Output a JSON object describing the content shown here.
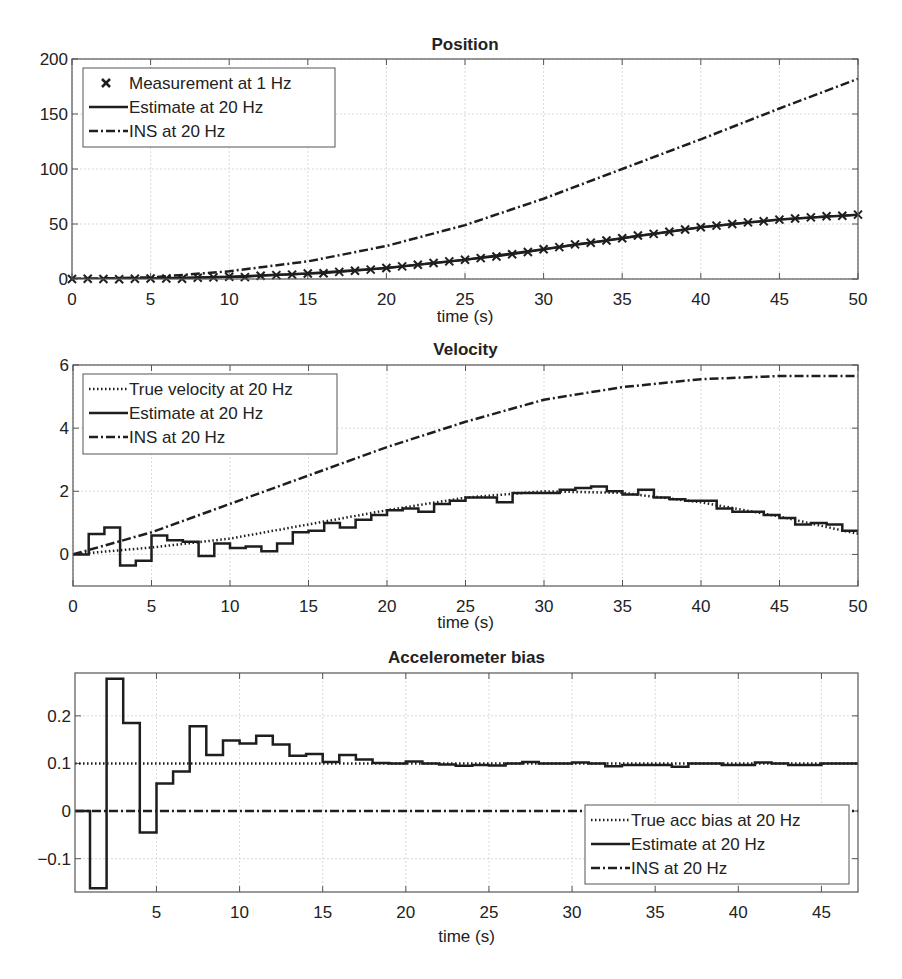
{
  "figure": {
    "width": 902,
    "height": 979
  },
  "colors": {
    "line": "#1e1e1e",
    "grid": "#d9d9d9",
    "axis": "#555555",
    "text": "#222222"
  },
  "chart_data": [
    {
      "type": "line",
      "title": "Position",
      "xlabel": "time (s)",
      "ylabel": "",
      "xlim": [
        0,
        50
      ],
      "ylim": [
        0,
        200
      ],
      "xticks": [
        0,
        5,
        10,
        15,
        20,
        25,
        30,
        35,
        40,
        45,
        50
      ],
      "yticks": [
        0,
        50,
        100,
        150,
        200
      ],
      "grid": true,
      "legend_position": "upper-left",
      "legend": [
        "Measurement at 1 Hz",
        "Estimate at 20 Hz",
        "INS at 20 Hz"
      ],
      "series": [
        {
          "name": "Measurement at 1 Hz",
          "style": "marker-x",
          "x": [
            0,
            1,
            2,
            3,
            4,
            5,
            6,
            7,
            8,
            9,
            10,
            11,
            12,
            13,
            14,
            15,
            16,
            17,
            18,
            19,
            20,
            21,
            22,
            23,
            24,
            25,
            26,
            27,
            28,
            29,
            30,
            31,
            32,
            33,
            34,
            35,
            36,
            37,
            38,
            39,
            40,
            41,
            42,
            43,
            44,
            45,
            46,
            47,
            48,
            49,
            50
          ],
          "y": [
            0,
            0.3,
            0,
            -0.3,
            0.3,
            0.5,
            0.5,
            0.3,
            1.2,
            1.5,
            2,
            1.7,
            3,
            3.5,
            4,
            5,
            5.3,
            6.5,
            7.5,
            8.5,
            10,
            11.5,
            13,
            14.5,
            16,
            17.5,
            19,
            20.5,
            22.5,
            24.5,
            27,
            29,
            31.5,
            33,
            35,
            37,
            39.5,
            41,
            43,
            45,
            47,
            48.5,
            50,
            51.5,
            52.5,
            54,
            55,
            56,
            57,
            57.5,
            58.5
          ]
        },
        {
          "name": "Estimate at 20 Hz",
          "style": "solid",
          "x": [
            0,
            5,
            10,
            15,
            20,
            25,
            30,
            35,
            40,
            45,
            50
          ],
          "y": [
            0,
            0.5,
            2,
            5,
            10,
            17.5,
            27,
            37,
            47,
            54,
            58.5
          ]
        },
        {
          "name": "INS at 20 Hz",
          "style": "dashdot",
          "x": [
            0,
            5,
            10,
            15,
            20,
            25,
            30,
            35,
            40,
            45,
            50
          ],
          "y": [
            0,
            1.5,
            7,
            16,
            30,
            49,
            73,
            100,
            127,
            155,
            182
          ]
        }
      ]
    },
    {
      "type": "line",
      "title": "Velocity",
      "xlabel": "time (s)",
      "ylabel": "",
      "xlim": [
        0,
        50
      ],
      "ylim": [
        -1,
        6
      ],
      "xticks": [
        0,
        5,
        10,
        15,
        20,
        25,
        30,
        35,
        40,
        45,
        50
      ],
      "yticks": [
        0,
        2,
        4,
        6
      ],
      "grid": true,
      "legend_position": "upper-left",
      "legend": [
        "True velocity at 20 Hz",
        "Estimate at 20 Hz",
        "INS at 20 Hz"
      ],
      "series": [
        {
          "name": "True velocity at 20 Hz",
          "style": "dotted",
          "x": [
            0,
            5,
            10,
            15,
            20,
            25,
            30,
            35,
            40,
            45,
            50
          ],
          "y": [
            0,
            0.22,
            0.5,
            0.95,
            1.4,
            1.8,
            2.0,
            1.95,
            1.65,
            1.2,
            0.65
          ]
        },
        {
          "name": "Estimate at 20 Hz",
          "style": "solid-step",
          "x": [
            0,
            1,
            2,
            3,
            4,
            5,
            6,
            7,
            8,
            9,
            10,
            11,
            12,
            13,
            14,
            15,
            16,
            17,
            18,
            19,
            20,
            21,
            22,
            23,
            24,
            25,
            26,
            27,
            28,
            29,
            30,
            31,
            32,
            33,
            34,
            35,
            36,
            37,
            38,
            39,
            40,
            41,
            42,
            43,
            44,
            45,
            46,
            47,
            48,
            49,
            50
          ],
          "y": [
            0,
            0.65,
            0.85,
            -0.35,
            -0.2,
            0.6,
            0.45,
            0.4,
            -0.05,
            0.35,
            0.2,
            0.25,
            0.1,
            0.35,
            0.7,
            0.75,
            1.0,
            0.85,
            1.1,
            1.25,
            1.4,
            1.45,
            1.35,
            1.6,
            1.7,
            1.8,
            1.8,
            1.65,
            1.95,
            1.95,
            1.95,
            2.05,
            2.1,
            2.15,
            2.0,
            1.9,
            2.05,
            1.8,
            1.75,
            1.7,
            1.7,
            1.45,
            1.35,
            1.35,
            1.25,
            1.15,
            0.95,
            1.0,
            0.95,
            0.75,
            0.65
          ]
        },
        {
          "name": "INS at 20 Hz",
          "style": "dashdot",
          "x": [
            0,
            5,
            10,
            15,
            20,
            25,
            30,
            35,
            40,
            45,
            50
          ],
          "y": [
            0,
            0.7,
            1.6,
            2.5,
            3.4,
            4.2,
            4.9,
            5.3,
            5.55,
            5.65,
            5.65
          ]
        }
      ]
    },
    {
      "type": "line",
      "title": "Accelerometer bias",
      "xlabel": "time (s)",
      "ylabel": "",
      "xlim": [
        0.1,
        47.2
      ],
      "ylim": [
        -0.17,
        0.29
      ],
      "xticks": [
        5,
        10,
        15,
        20,
        25,
        30,
        35,
        40,
        45
      ],
      "yticks": [
        -0.1,
        0,
        0.1,
        0.2
      ],
      "grid": true,
      "legend_position": "lower-right",
      "legend": [
        "True acc bias at 20 Hz",
        "Estimate at 20 Hz",
        "INS at 20 Hz"
      ],
      "series": [
        {
          "name": "True acc bias at 20 Hz",
          "style": "dotted",
          "x": [
            0.1,
            47.2
          ],
          "y": [
            0.1,
            0.1
          ]
        },
        {
          "name": "Estimate at 20 Hz",
          "style": "solid-step",
          "x": [
            0.1,
            1,
            2,
            3,
            4,
            5,
            6,
            7,
            8,
            9,
            10,
            11,
            12,
            13,
            14,
            15,
            16,
            17,
            18,
            19,
            20,
            21,
            22,
            23,
            24,
            25,
            26,
            27,
            28,
            29,
            30,
            31,
            32,
            33,
            34,
            35,
            36,
            37,
            38,
            39,
            40,
            41,
            42,
            43,
            44,
            45,
            46,
            47,
            47.2
          ],
          "y": [
            0,
            -0.162,
            0.278,
            0.185,
            -0.045,
            0.058,
            0.083,
            0.178,
            0.118,
            0.148,
            0.142,
            0.158,
            0.14,
            0.116,
            0.12,
            0.103,
            0.118,
            0.108,
            0.101,
            0.1,
            0.104,
            0.1,
            0.098,
            0.095,
            0.097,
            0.096,
            0.1,
            0.103,
            0.1,
            0.1,
            0.102,
            0.1,
            0.094,
            0.097,
            0.097,
            0.097,
            0.093,
            0.1,
            0.1,
            0.097,
            0.097,
            0.102,
            0.1,
            0.097,
            0.097,
            0.1,
            0.1,
            0.1,
            0.1
          ]
        },
        {
          "name": "INS at 20 Hz",
          "style": "dashdot",
          "x": [
            0.1,
            47.2
          ],
          "y": [
            0,
            0
          ]
        }
      ]
    }
  ],
  "layout": {
    "panels": [
      {
        "left": 72,
        "right": 858,
        "top": 59,
        "bottom": 279,
        "title_y": 50,
        "xlabel_y": 322,
        "ticklabel_y": 305
      },
      {
        "left": 73,
        "right": 858,
        "top": 365,
        "bottom": 586,
        "title_y": 355,
        "xlabel_y": 628,
        "ticklabel_y": 612
      },
      {
        "left": 75,
        "right": 858,
        "top": 673,
        "bottom": 892,
        "title_y": 663,
        "xlabel_y": 942,
        "ticklabel_y": 918
      }
    ],
    "legends": [
      {
        "x": 83,
        "y": 68,
        "w": 252,
        "h": 79
      },
      {
        "x": 83,
        "y": 374,
        "w": 254,
        "h": 80
      },
      {
        "x": 585,
        "y": 805,
        "w": 264,
        "h": 79
      }
    ]
  }
}
